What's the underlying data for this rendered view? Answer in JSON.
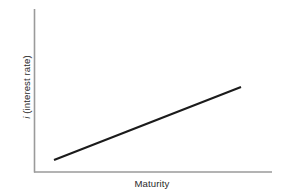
{
  "figure": {
    "background_color": "#ffffff",
    "width": 286,
    "height": 196
  },
  "axes": {
    "x_label": "Maturity",
    "y_label_symbol": "i",
    "y_label_rest": " (interest rate)",
    "y_label_full": "i (interest rate)",
    "axis_color": "#9a9a9a"
  },
  "curve": {
    "color": "#1b1b1b",
    "stroke_width": 2.1
  },
  "chart_data": {
    "type": "line",
    "title": "",
    "subtitle": "",
    "xlabel": "Maturity",
    "ylabel": "i (interest rate)",
    "grid": false,
    "legend": false,
    "legend_position": "none",
    "xlim": [
      0,
      1
    ],
    "ylim": [
      0,
      1
    ],
    "xticks": [],
    "yticks": [],
    "xticklabels": [],
    "yticklabels": [],
    "annotations": [],
    "series": [
      {
        "name": "Normal upward-sloping yield curve",
        "color": "#1b1b1b",
        "x": [
          0.084,
          1.0
        ],
        "y": [
          0.074,
          0.521
        ],
        "points_px": [
          [
            54,
            160
          ],
          [
            241,
            87
          ]
        ],
        "shape": "straight upward-sloping line"
      }
    ]
  }
}
